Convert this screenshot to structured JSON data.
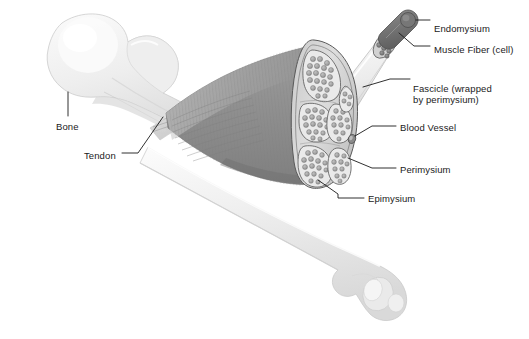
{
  "figure": {
    "background": "#ffffff"
  },
  "labels": [
    {
      "id": "endomysium",
      "text": "Endomysium",
      "x": 434,
      "y": 23
    },
    {
      "id": "muscle-fiber",
      "text": "Muscle Fiber (cell)",
      "x": 434,
      "y": 44
    },
    {
      "id": "fascicle-1",
      "text": "Fascicle (wrapped",
      "x": 413,
      "y": 83
    },
    {
      "id": "fascicle-2",
      "text": "by perimysium)",
      "x": 413,
      "y": 94
    },
    {
      "id": "blood-vessel",
      "text": "Blood Vessel",
      "x": 400,
      "y": 122
    },
    {
      "id": "perimysium",
      "text": "Perimysium",
      "x": 400,
      "y": 164
    },
    {
      "id": "epimysium",
      "text": "Epimysium",
      "x": 368,
      "y": 193
    },
    {
      "id": "bone",
      "text": "Bone",
      "x": 56,
      "y": 121
    },
    {
      "id": "tendon",
      "text": "Tendon",
      "x": 84,
      "y": 150
    }
  ],
  "colors": {
    "bone_light": "#f2f2f2",
    "bone_mid": "#e4e4e4",
    "bone_shadow": "#cfcfcf",
    "muscle_dark": "#8e8e8e",
    "muscle_mid": "#a6a6a6",
    "muscle_light": "#bdbdbd",
    "epimysium_fill": "#dcdcdc",
    "fascicle_fill": "#e6e6e6",
    "fiber_fill": "#a8a8a8",
    "fiber_stroke": "#6e6e6e",
    "fiber_dark": "#7a7a7a",
    "outline": "#4a4a4a",
    "leader": "#1a1a1a",
    "text": "#1a1a1a"
  },
  "structures": {
    "bone_upper": "proximal femur head with greater trochanter, upper left",
    "bone_lower": "femoral shaft descending to distal condyles, lower right",
    "muscle_belly": "striated muscle belly spanning from tendon to cross-section",
    "tendon": "tapered tendon attaching muscle to bone shaft",
    "cross_section": "oval cut face of muscle showing fascicles in epimysium",
    "fascicle_cylinder": "extracted fascicle cylinder projecting upper right",
    "muscle_fiber_probe": "single muscle fiber protruding from fascicle end"
  },
  "counts": {
    "fascicle_lobes": 6,
    "fibers_visible_approx": 120
  }
}
